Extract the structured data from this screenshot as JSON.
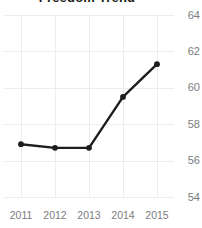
{
  "chart_data": {
    "type": "line",
    "title": "Freedom Trend",
    "xlabel": "",
    "ylabel": "",
    "categories": [
      "2011",
      "2012",
      "2013",
      "2014",
      "2015"
    ],
    "x": [
      2011,
      2012,
      2013,
      2014,
      2015
    ],
    "values": [
      56.9,
      56.7,
      56.7,
      59.5,
      61.3
    ],
    "series": [
      {
        "name": "Freedom Trend",
        "values": [
          56.9,
          56.7,
          56.7,
          59.5,
          61.3
        ],
        "color": "#1d1d1d",
        "marker": "circle"
      }
    ],
    "ylim": [
      54,
      64
    ],
    "yticks": [
      64,
      62,
      60,
      58,
      56,
      54
    ],
    "ytick_labels": [
      "64",
      "62",
      "60",
      "58",
      "56",
      "54"
    ],
    "xticks": [
      2011,
      2012,
      2013,
      2014,
      2015
    ],
    "xtick_labels": [
      "2011",
      "2012",
      "2013",
      "2014",
      "2015"
    ],
    "grid": true,
    "grid_color": "#eceded",
    "y_axis_position": "right",
    "legend": false,
    "legend_position": "none",
    "background": "#ffffff",
    "tick_label_color": "#7b7c7e",
    "title_color": "#1a1a1a"
  }
}
